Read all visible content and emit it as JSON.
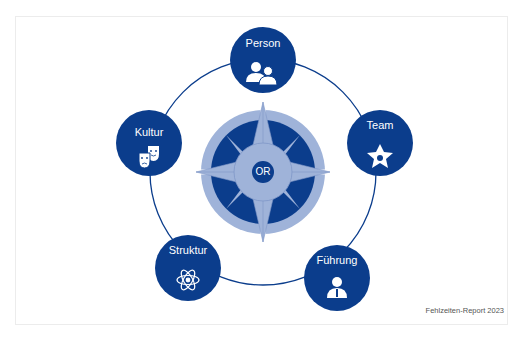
{
  "diagram": {
    "center": {
      "label": "OR",
      "icon": "compass-rose-icon"
    },
    "nodes": [
      {
        "label": "Person",
        "icon": "people-icon"
      },
      {
        "label": "Team",
        "icon": "team-star-icon"
      },
      {
        "label": "Führung",
        "icon": "leader-icon"
      },
      {
        "label": "Struktur",
        "icon": "atom-icon"
      },
      {
        "label": "Kultur",
        "icon": "theater-masks-icon"
      }
    ],
    "colors": {
      "dark": "#0b3d8c",
      "light": "#9fb3d9",
      "mid": "#7f97c8",
      "ring": "#0b3d8c"
    }
  },
  "footer": {
    "source": "Fehlzeiten-Report 2023"
  }
}
